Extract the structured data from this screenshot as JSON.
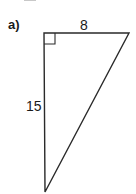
{
  "figure": {
    "part_label": "a)",
    "shape": "right-triangle",
    "sides": {
      "top": "8",
      "left": "15"
    },
    "right_angle_vertex": "top-left",
    "vertices": {
      "top_left": [
        44,
        33
      ],
      "top_right": [
        129,
        33
      ],
      "bottom": [
        45,
        192
      ]
    },
    "right_angle_marker_size": 11,
    "stroke_color": "#2a2a2a",
    "text_color": "#1a1a1a"
  }
}
